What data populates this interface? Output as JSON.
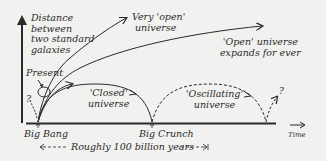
{
  "diagram": {
    "y_axis_label": [
      "Distance",
      "between",
      "two standard",
      "galaxies"
    ],
    "x_axis_label": "Time",
    "markers": {
      "present": "Present",
      "big_bang": "Big Bang",
      "big_crunch": "Big Crunch",
      "question_left": "?",
      "question_right": "?"
    },
    "curves": {
      "very_open": [
        "Very 'open'",
        "universe"
      ],
      "open": [
        "'Open' universe",
        "expands for ever"
      ],
      "closed": [
        "'Closed'",
        "universe"
      ],
      "oscillating": [
        "'Oscillating'",
        "universe"
      ]
    },
    "span_label": "← - - - Roughly 100 billion years - - →",
    "span_text": "Roughly 100 billion years",
    "colors": {
      "ink": "#2a2a2a",
      "background": "#f1f1ef"
    }
  }
}
